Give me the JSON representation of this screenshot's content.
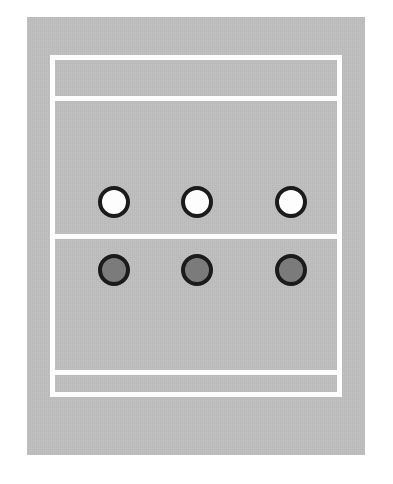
{
  "diagram": {
    "title": "Volleyball Court Player Formation Diagram",
    "type": "court-diagram",
    "sport": "volleyball",
    "orientation": "portrait"
  },
  "colors": {
    "court_surface": "#b9b9b9",
    "court_line": "#fdfdfd",
    "token_outline": "#1b1b1b",
    "token_fill_white": "#fdfdfd",
    "token_fill_gray": "#7b7b7b",
    "page_background": "#ffffff"
  },
  "court": {
    "surface_label": "court-surface",
    "boundary_label": "court-boundary",
    "lines": [
      {
        "id": "attack-line-top",
        "label": "Attack Line (Far Court)"
      },
      {
        "id": "center-line",
        "label": "Center Line / Net"
      },
      {
        "id": "attack-line-bottom",
        "label": "Attack Line (Near Court)"
      }
    ],
    "zones": [
      {
        "id": "zone-far-back",
        "label": "Far Back Zone"
      },
      {
        "id": "zone-far-front",
        "label": "Far Front Zone"
      },
      {
        "id": "zone-near-front",
        "label": "Near Front Zone"
      },
      {
        "id": "zone-near-back",
        "label": "Near Back Zone"
      }
    ]
  },
  "teams": [
    {
      "id": "team-white",
      "label": "White Team",
      "fill": "#fdfdfd",
      "row": "far-side",
      "players": [
        {
          "id": "player-w-1",
          "label": "White Player 1",
          "position": "left"
        },
        {
          "id": "player-w-2",
          "label": "White Player 2",
          "position": "center"
        },
        {
          "id": "player-w-3",
          "label": "White Player 3",
          "position": "right"
        }
      ]
    },
    {
      "id": "team-gray",
      "label": "Gray Team",
      "fill": "#7b7b7b",
      "row": "near-side",
      "players": [
        {
          "id": "player-g-1",
          "label": "Gray Player 1",
          "position": "left"
        },
        {
          "id": "player-g-2",
          "label": "Gray Player 2",
          "position": "center"
        },
        {
          "id": "player-g-3",
          "label": "Gray Player 3",
          "position": "right"
        }
      ]
    }
  ]
}
